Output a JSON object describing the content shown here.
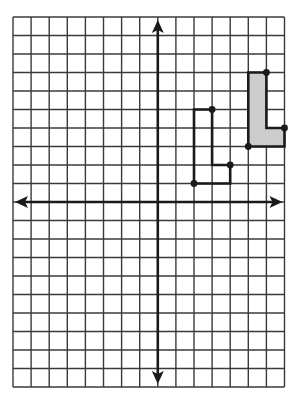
{
  "diagram": {
    "type": "coordinate-grid",
    "grid": {
      "columns": 15,
      "rows": 20,
      "left_px": 13,
      "top_px": 17,
      "cell_w_px": 18.1,
      "cell_h_px": 18.5,
      "origin_col": 8,
      "origin_row": 10,
      "line_color": "#3a3a3a",
      "axis_color": "#1a1a1a"
    },
    "axes": {
      "x_axis": {
        "arrows": [
          "left",
          "right"
        ]
      },
      "y_axis": {
        "arrows": [
          "up",
          "down"
        ]
      }
    },
    "shapes": [
      {
        "name": "preimage-l-shape",
        "shaded": true,
        "fill": "#cccccc",
        "vertices": [
          [
            5,
            7
          ],
          [
            6,
            7
          ],
          [
            6,
            4
          ],
          [
            7,
            4
          ],
          [
            7,
            3
          ],
          [
            5,
            3
          ]
        ],
        "marked_points": [
          [
            6,
            7
          ],
          [
            7,
            4
          ],
          [
            5,
            3
          ]
        ]
      },
      {
        "name": "image-l-shape",
        "shaded": false,
        "fill": "none",
        "vertices": [
          [
            2,
            5
          ],
          [
            3,
            5
          ],
          [
            3,
            2
          ],
          [
            4,
            2
          ],
          [
            4,
            1
          ],
          [
            2,
            1
          ]
        ],
        "marked_points": [
          [
            3,
            5
          ],
          [
            4,
            2
          ],
          [
            2,
            1
          ]
        ]
      }
    ],
    "stroke_color": "#1a1a1a"
  }
}
